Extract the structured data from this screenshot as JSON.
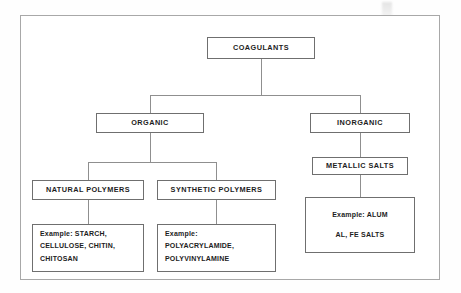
{
  "diagram": {
    "frame": {
      "border_color": "#a8a8a8",
      "background": "#ffffff"
    },
    "line_color": "#8f8f8f",
    "box_border_color": "#6f6f6f",
    "text_color": "#1d1d1d",
    "nodes": {
      "coagulants": {
        "label": "COAGULANTS"
      },
      "organic": {
        "label": "ORGANIC"
      },
      "inorganic": {
        "label": "INORGANIC"
      },
      "metallic_salts": {
        "label": "METALLIC SALTS"
      },
      "natural_polymers": {
        "label": "NATURAL POLYMERS"
      },
      "synthetic_polymers": {
        "label": "SYNTHETIC POLYMERS"
      },
      "example_natural": {
        "lines": [
          "Example: STARCH,",
          "CELLULOSE, CHITIN,",
          "CHITOSAN"
        ]
      },
      "example_synthetic": {
        "lines": [
          "Example:",
          "POLYACRYLAMIDE,",
          "POLYVINYLAMINE"
        ]
      },
      "example_inorganic": {
        "lines": [
          "Example: ALUM",
          "AL, FE SALTS"
        ]
      }
    }
  }
}
